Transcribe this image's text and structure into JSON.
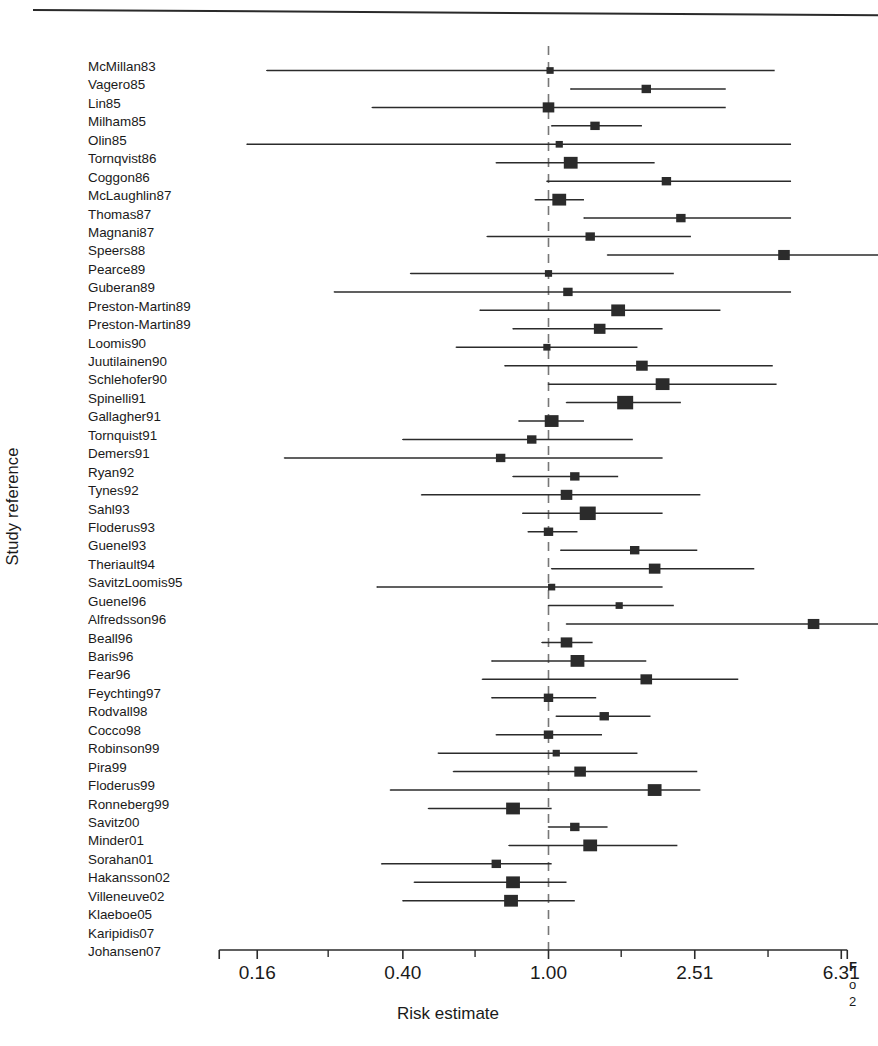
{
  "figure": {
    "ylabel": "Study reference",
    "xlabel": "Risk estimate",
    "caption_fragment_1": "F",
    "caption_fragment_2": "o",
    "caption_fragment_3": "2"
  },
  "chart_data": {
    "type": "scatter",
    "subtype": "forest-plot",
    "title": "",
    "xlabel": "Risk estimate",
    "ylabel": "Study reference",
    "xscale": "log",
    "xlim": [
      0.125,
      7.95
    ],
    "grid": false,
    "legend": null,
    "reference_line": 1.0,
    "reference_line_style": "dashed",
    "xticks": [
      0.16,
      0.4,
      1.0,
      2.51,
      6.31
    ],
    "xtick_labels": [
      "0.16",
      "0.40",
      "1.00",
      "2.51",
      "6.31"
    ],
    "minor_ticks": [
      0.25,
      0.63,
      1.58,
      3.98
    ],
    "marker_shape": "square",
    "marker_color": "#2b2b2b",
    "line_color": "#2b2b2b",
    "categories": [
      "McMillan83",
      "Vagero85",
      "Lin85",
      "Milham85",
      "Olin85",
      "Tornqvist86",
      "Coggon86",
      "McLaughlin87",
      "Thomas87",
      "Magnani87",
      "Speers88",
      "Pearce89",
      "Guberan89",
      "Preston-Martin89",
      "Preston-Martin89",
      "Loomis90",
      "Juutilainen90",
      "Schlehofer90",
      "Spinelli91",
      "Gallagher91",
      "Tornquist91",
      "Demers91",
      "Ryan92",
      "Tynes92",
      "Sahl93",
      "Floderus93",
      "Guenel93",
      "Theriault94",
      "SavitzLoomis95",
      "Guenel96",
      "Alfredsson96",
      "Beall96",
      "Baris96",
      "Fear96",
      "Feychting97",
      "Rodvall98",
      "Cocco98",
      "Robinson99",
      "Pira99",
      "Floderus99",
      "Ronneberg99",
      "Savitz00",
      "Minder01",
      "Sorahan01",
      "Hakansson02",
      "Villeneuve02",
      "Klaeboe05",
      "Karipidis07",
      "Johansen07"
    ],
    "points": [
      {
        "study": "McMillan83",
        "estimate": 1.01,
        "ci_low": 0.17,
        "ci_high": 4.15,
        "weight": 1,
        "ci_low_clipped": false,
        "ci_high_clipped": false
      },
      {
        "study": "Vagero85",
        "estimate": 1.85,
        "ci_low": 1.15,
        "ci_high": 3.05,
        "weight": 2,
        "ci_low_clipped": false,
        "ci_high_clipped": false
      },
      {
        "study": "Lin85",
        "estimate": 1.0,
        "ci_low": 0.33,
        "ci_high": 3.05,
        "weight": 3,
        "ci_low_clipped": false,
        "ci_high_clipped": false
      },
      {
        "study": "Milham85",
        "estimate": 1.34,
        "ci_low": 1.02,
        "ci_high": 1.8,
        "weight": 2,
        "ci_low_clipped": false,
        "ci_high_clipped": false
      },
      {
        "study": "Olin85",
        "estimate": 1.07,
        "ci_low": 0.15,
        "ci_high": 4.6,
        "weight": 1,
        "ci_low_clipped": false,
        "ci_high_clipped": false
      },
      {
        "study": "Tornqvist86",
        "estimate": 1.15,
        "ci_low": 0.72,
        "ci_high": 1.95,
        "weight": 4,
        "ci_low_clipped": false,
        "ci_high_clipped": false
      },
      {
        "study": "Coggon86",
        "estimate": 2.1,
        "ci_low": 0.99,
        "ci_high": 4.6,
        "weight": 2,
        "ci_low_clipped": false,
        "ci_high_clipped": false
      },
      {
        "study": "McLaughlin87",
        "estimate": 1.07,
        "ci_low": 0.92,
        "ci_high": 1.25,
        "weight": 4,
        "ci_low_clipped": false,
        "ci_high_clipped": false
      },
      {
        "study": "Thomas87",
        "estimate": 2.3,
        "ci_low": 1.25,
        "ci_high": 4.6,
        "weight": 2,
        "ci_low_clipped": false,
        "ci_high_clipped": false
      },
      {
        "study": "Magnani87",
        "estimate": 1.3,
        "ci_low": 0.68,
        "ci_high": 2.45,
        "weight": 2,
        "ci_low_clipped": false,
        "ci_high_clipped": false
      },
      {
        "study": "Speers88",
        "estimate": 4.4,
        "ci_low": 1.45,
        "ci_high": 11.5,
        "weight": 3,
        "ci_low_clipped": false,
        "ci_high_clipped": true
      },
      {
        "study": "Pearce89",
        "estimate": 1.0,
        "ci_low": 0.42,
        "ci_high": 2.2,
        "weight": 1,
        "ci_low_clipped": false,
        "ci_high_clipped": false
      },
      {
        "study": "Guberan89",
        "estimate": 1.13,
        "ci_low": 0.26,
        "ci_high": 4.6,
        "weight": 2,
        "ci_low_clipped": false,
        "ci_high_clipped": false
      },
      {
        "study": "Preston-Martin89",
        "estimate": 1.55,
        "ci_low": 0.65,
        "ci_high": 2.95,
        "weight": 4,
        "ci_low_clipped": false,
        "ci_high_clipped": false
      },
      {
        "study": "Preston-Martin89",
        "estimate": 1.38,
        "ci_low": 0.8,
        "ci_high": 2.05,
        "weight": 3,
        "ci_low_clipped": false,
        "ci_high_clipped": false
      },
      {
        "study": "Loomis90",
        "estimate": 0.99,
        "ci_low": 0.56,
        "ci_high": 1.75,
        "weight": 1,
        "ci_low_clipped": false,
        "ci_high_clipped": false
      },
      {
        "study": "Juutilainen90",
        "estimate": 1.8,
        "ci_low": 0.76,
        "ci_high": 4.1,
        "weight": 3,
        "ci_low_clipped": false,
        "ci_high_clipped": false
      },
      {
        "study": "Schlehofer90",
        "estimate": 2.05,
        "ci_low": 1.0,
        "ci_high": 4.2,
        "weight": 4,
        "ci_low_clipped": false,
        "ci_high_clipped": false
      },
      {
        "study": "Spinelli91",
        "estimate": 1.62,
        "ci_low": 1.12,
        "ci_high": 2.3,
        "weight": 5,
        "ci_low_clipped": false,
        "ci_high_clipped": false
      },
      {
        "study": "Gallagher91",
        "estimate": 1.02,
        "ci_low": 0.83,
        "ci_high": 1.25,
        "weight": 4,
        "ci_low_clipped": false,
        "ci_high_clipped": false
      },
      {
        "study": "Tornquist91",
        "estimate": 0.9,
        "ci_low": 0.4,
        "ci_high": 1.7,
        "weight": 2,
        "ci_low_clipped": false,
        "ci_high_clipped": false
      },
      {
        "study": "Demers91",
        "estimate": 0.74,
        "ci_low": 0.19,
        "ci_high": 2.05,
        "weight": 2,
        "ci_low_clipped": false,
        "ci_high_clipped": false
      },
      {
        "study": "Ryan92",
        "estimate": 1.18,
        "ci_low": 0.8,
        "ci_high": 1.55,
        "weight": 2,
        "ci_low_clipped": false,
        "ci_high_clipped": false
      },
      {
        "study": "Tynes92",
        "estimate": 1.12,
        "ci_low": 0.45,
        "ci_high": 2.6,
        "weight": 3,
        "ci_low_clipped": false,
        "ci_high_clipped": false
      },
      {
        "study": "Sahl93",
        "estimate": 1.28,
        "ci_low": 0.85,
        "ci_high": 2.05,
        "weight": 5,
        "ci_low_clipped": false,
        "ci_high_clipped": false
      },
      {
        "study": "Floderus93",
        "estimate": 1.0,
        "ci_low": 0.88,
        "ci_high": 1.2,
        "weight": 2,
        "ci_low_clipped": false,
        "ci_high_clipped": false
      },
      {
        "study": "Guenel93",
        "estimate": 1.72,
        "ci_low": 1.08,
        "ci_high": 2.55,
        "weight": 2,
        "ci_low_clipped": false,
        "ci_high_clipped": false
      },
      {
        "study": "Theriault94",
        "estimate": 1.95,
        "ci_low": 1.02,
        "ci_high": 3.65,
        "weight": 3,
        "ci_low_clipped": false,
        "ci_high_clipped": false
      },
      {
        "study": "SavitzLoomis95",
        "estimate": 1.02,
        "ci_low": 0.34,
        "ci_high": 2.05,
        "weight": 1,
        "ci_low_clipped": false,
        "ci_high_clipped": false
      },
      {
        "study": "Guenel96",
        "estimate": 1.56,
        "ci_low": 1.0,
        "ci_high": 2.2,
        "weight": 1,
        "ci_low_clipped": false,
        "ci_high_clipped": false
      },
      {
        "study": "Alfredsson96",
        "estimate": 5.3,
        "ci_low": 1.12,
        "ci_high": 9.2,
        "weight": 3,
        "ci_low_clipped": false,
        "ci_high_clipped": true
      },
      {
        "study": "Beall96",
        "estimate": 1.12,
        "ci_low": 0.96,
        "ci_high": 1.32,
        "weight": 3,
        "ci_low_clipped": false,
        "ci_high_clipped": false
      },
      {
        "study": "Baris96",
        "estimate": 1.2,
        "ci_low": 0.7,
        "ci_high": 1.85,
        "weight": 4,
        "ci_low_clipped": false,
        "ci_high_clipped": false
      },
      {
        "study": "Fear96",
        "estimate": 1.85,
        "ci_low": 0.66,
        "ci_high": 3.3,
        "weight": 3,
        "ci_low_clipped": false,
        "ci_high_clipped": false
      },
      {
        "study": "Feychting97",
        "estimate": 1.0,
        "ci_low": 0.7,
        "ci_high": 1.35,
        "weight": 2,
        "ci_low_clipped": false,
        "ci_high_clipped": false
      },
      {
        "study": "Rodvall98",
        "estimate": 1.42,
        "ci_low": 1.05,
        "ci_high": 1.9,
        "weight": 2,
        "ci_low_clipped": false,
        "ci_high_clipped": false
      },
      {
        "study": "Cocco98",
        "estimate": 1.0,
        "ci_low": 0.72,
        "ci_high": 1.4,
        "weight": 2,
        "ci_low_clipped": false,
        "ci_high_clipped": false
      },
      {
        "study": "Robinson99",
        "estimate": 1.05,
        "ci_low": 0.5,
        "ci_high": 1.75,
        "weight": 1,
        "ci_low_clipped": false,
        "ci_high_clipped": false
      },
      {
        "study": "Pira99",
        "estimate": 1.22,
        "ci_low": 0.55,
        "ci_high": 2.55,
        "weight": 3,
        "ci_low_clipped": false,
        "ci_high_clipped": false
      },
      {
        "study": "Floderus99",
        "estimate": 1.95,
        "ci_low": 0.37,
        "ci_high": 2.6,
        "weight": 4,
        "ci_low_clipped": false,
        "ci_high_clipped": true
      },
      {
        "study": "Ronneberg99",
        "estimate": 0.8,
        "ci_low": 0.47,
        "ci_high": 1.02,
        "weight": 4,
        "ci_low_clipped": false,
        "ci_high_clipped": false
      },
      {
        "study": "Savitz00",
        "estimate": 1.18,
        "ci_low": 1.0,
        "ci_high": 1.45,
        "weight": 2,
        "ci_low_clipped": false,
        "ci_high_clipped": false
      },
      {
        "study": "Minder01",
        "estimate": 1.3,
        "ci_low": 0.78,
        "ci_high": 2.25,
        "weight": 4,
        "ci_low_clipped": false,
        "ci_high_clipped": false
      },
      {
        "study": "Sorahan01",
        "estimate": 0.72,
        "ci_low": 0.35,
        "ci_high": 1.02,
        "weight": 2,
        "ci_low_clipped": false,
        "ci_high_clipped": false
      },
      {
        "study": "Hakansson02",
        "estimate": 0.8,
        "ci_low": 0.43,
        "ci_high": 1.12,
        "weight": 4,
        "ci_low_clipped": false,
        "ci_high_clipped": false
      },
      {
        "study": "Villeneuve02",
        "estimate": 0.79,
        "ci_low": 0.4,
        "ci_high": 1.18,
        "weight": 4,
        "ci_low_clipped": false,
        "ci_high_clipped": false
      },
      {
        "study": "Klaeboe05",
        "estimate": null,
        "ci_low": null,
        "ci_high": null,
        "weight": 0,
        "ci_low_clipped": false,
        "ci_high_clipped": false
      },
      {
        "study": "Karipidis07",
        "estimate": null,
        "ci_low": null,
        "ci_high": null,
        "weight": 0,
        "ci_low_clipped": false,
        "ci_high_clipped": false
      },
      {
        "study": "Johansen07",
        "estimate": null,
        "ci_low": null,
        "ci_high": null,
        "weight": 0,
        "ci_low_clipped": false,
        "ci_high_clipped": false
      }
    ]
  }
}
